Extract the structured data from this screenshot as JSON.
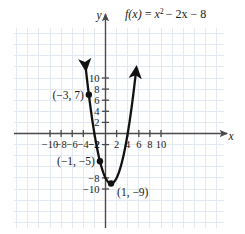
{
  "chart_data": {
    "type": "line",
    "title": "",
    "function_label": "f(x) = x² − 2x − 8",
    "function_label_parts": {
      "name": "f",
      "arg": "(x)",
      "equals": "=",
      "base": "x",
      "exponent": "2",
      "rest": "− 2x − 8"
    },
    "xlabel": "x",
    "ylabel": "y",
    "xlim": [
      -12,
      12
    ],
    "ylim": [
      -11.6,
      12.2
    ],
    "grid": true,
    "grid_step": 2,
    "grid_color": "#e3e9f0",
    "axis_color": "#4a4a4a",
    "curve_color": "#111111",
    "xticks": [
      -10,
      -8,
      -6,
      -4,
      -2,
      2,
      4,
      6,
      8,
      10
    ],
    "yticks": [
      10,
      8,
      6,
      4,
      2,
      -2,
      -8,
      -10
    ],
    "xtick_labels": [
      "−10",
      "−8",
      "−6",
      "−4",
      "−2",
      "2",
      "4",
      "6",
      "8",
      "10"
    ],
    "ytick_labels": [
      "10",
      "8",
      "6",
      "4",
      "2",
      "−2",
      "−8",
      "−10"
    ],
    "curve": {
      "equation": "y = x^2 - 2x - 8",
      "a": 1,
      "b": -2,
      "c": -8,
      "vertex": [
        1,
        -9
      ],
      "roots": [
        -2,
        4
      ],
      "y_intercept": -8,
      "x_domain_drawn": [
        -3.55,
        5.55
      ],
      "arrowheads": [
        "start",
        "end"
      ]
    },
    "points": [
      {
        "label": "(−3, 7)",
        "x": -3,
        "y": 7,
        "label_position": "left"
      },
      {
        "label": "(−1, −5)",
        "x": -1,
        "y": -5,
        "label_position": "left"
      },
      {
        "label": "(1, −9)",
        "x": 1,
        "y": -9,
        "label_position": "right"
      }
    ],
    "legend": null,
    "annotations": [
      "f(x) = x² − 2x − 8",
      "(−3, 7)",
      "(−1, −5)",
      "(1, −9)"
    ]
  }
}
